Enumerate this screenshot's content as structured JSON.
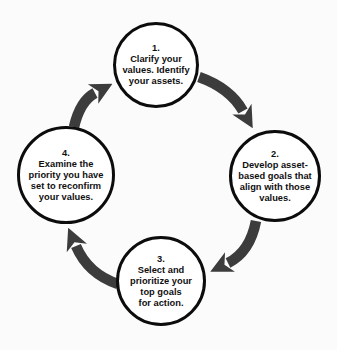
{
  "colors": {
    "background": "#fbfbfb",
    "circle_fill": "#ffffff",
    "circle_border": "#0c0c0c",
    "text": "#101010",
    "arrow": "#3c3c3c"
  },
  "steps": [
    {
      "number": "1",
      "text": "1.\nClarify your\nvalues. Identify\nyour assets."
    },
    {
      "number": "2",
      "text": "2.\nDevelop asset-\nbased goals that\nalign with those\nvalues."
    },
    {
      "number": "3",
      "text": "3.\nSelect and\nprioritize your\ntop goals\nfor action."
    },
    {
      "number": "4",
      "text": "4.\nExamine the\npriority you have\nset to reconfirm\nyour values."
    }
  ]
}
